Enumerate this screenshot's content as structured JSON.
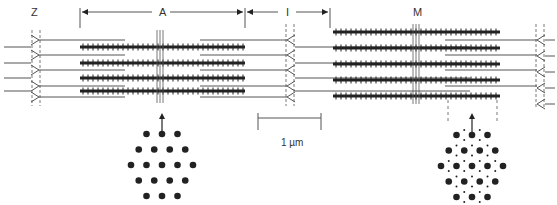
{
  "labels": {
    "z": "Z",
    "a": "A",
    "i": "I",
    "m": "M",
    "scale": "1 µm"
  },
  "colors": {
    "line": "#555555",
    "thick": "#222222",
    "dot": "#222222"
  },
  "diagram": {
    "left_sarcomere": {
      "thick_filaments": 4,
      "thin_filaments": 5,
      "cross_section": "thick filaments only (hexagonal lattice of 19 dots)"
    },
    "right_sarcomere": {
      "thick_filaments": 5,
      "thin_filaments": 4,
      "cross_section": "thick and thin filaments (large dots with small dots interleaved)"
    }
  }
}
